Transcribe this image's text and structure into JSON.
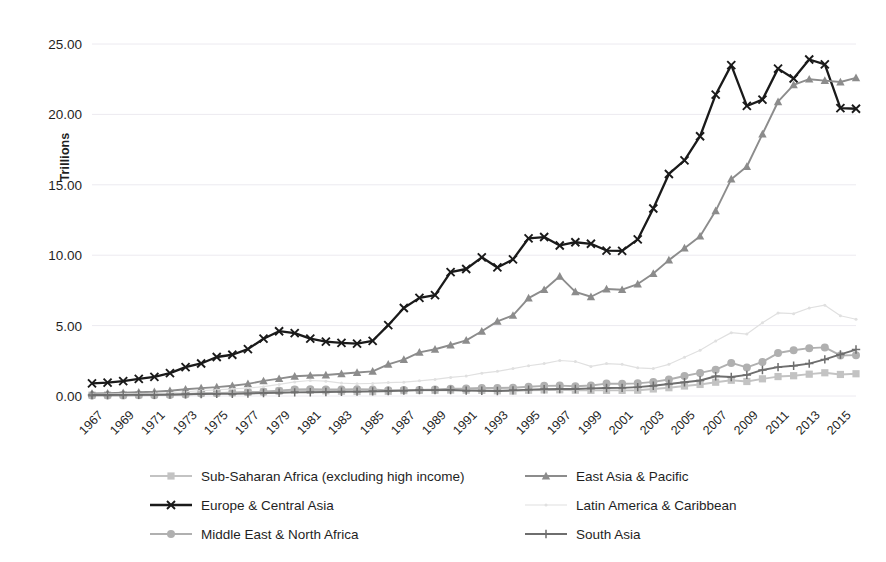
{
  "chart_data": {
    "type": "line",
    "title": "",
    "xlabel": "",
    "ylabel": "Trillions",
    "ylim": [
      0,
      25
    ],
    "ytick_labels": [
      "0.00",
      "5.00",
      "10.00",
      "15.00",
      "20.00",
      "25.00"
    ],
    "ytick_values": [
      0,
      5,
      10,
      15,
      20,
      25
    ],
    "grid": true,
    "legend_position": "bottom",
    "x": [
      1967,
      1968,
      1969,
      1970,
      1971,
      1972,
      1973,
      1974,
      1975,
      1976,
      1977,
      1978,
      1979,
      1980,
      1981,
      1982,
      1983,
      1984,
      1985,
      1986,
      1987,
      1988,
      1989,
      1990,
      1991,
      1992,
      1993,
      1994,
      1995,
      1996,
      1997,
      1998,
      1999,
      2000,
      2001,
      2002,
      2003,
      2004,
      2005,
      2006,
      2007,
      2008,
      2009,
      2010,
      2011,
      2012,
      2013,
      2014,
      2015,
      2016
    ],
    "xtick_labels": [
      "1967",
      "1969",
      "1971",
      "1973",
      "1975",
      "1977",
      "1979",
      "1981",
      "1983",
      "1985",
      "1987",
      "1989",
      "1991",
      "1993",
      "1995",
      "1997",
      "1999",
      "2001",
      "2003",
      "2005",
      "2007",
      "2009",
      "2011",
      "2013",
      "2015"
    ],
    "series": [
      {
        "name": "Sub-Saharan Africa (excluding high income)",
        "color": "#c3c3c3",
        "marker": "square",
        "values": [
          0.06,
          0.07,
          0.08,
          0.09,
          0.1,
          0.12,
          0.15,
          0.2,
          0.22,
          0.23,
          0.26,
          0.29,
          0.35,
          0.41,
          0.4,
          0.37,
          0.34,
          0.32,
          0.31,
          0.33,
          0.38,
          0.4,
          0.4,
          0.42,
          0.41,
          0.4,
          0.37,
          0.35,
          0.41,
          0.43,
          0.44,
          0.41,
          0.4,
          0.4,
          0.4,
          0.41,
          0.5,
          0.59,
          0.71,
          0.82,
          0.98,
          1.12,
          1.03,
          1.22,
          1.38,
          1.44,
          1.55,
          1.65,
          1.53,
          1.58
        ]
      },
      {
        "name": "Europe & Central Asia",
        "color": "#1a1a1a",
        "marker": "x",
        "values": [
          0.9,
          0.95,
          1.06,
          1.22,
          1.36,
          1.62,
          2.05,
          2.31,
          2.77,
          2.93,
          3.33,
          4.07,
          4.6,
          4.46,
          4.07,
          3.86,
          3.77,
          3.72,
          3.92,
          5.03,
          6.25,
          6.97,
          7.16,
          8.8,
          9.02,
          9.85,
          9.13,
          9.7,
          11.2,
          11.29,
          10.69,
          10.92,
          10.81,
          10.33,
          10.31,
          11.12,
          13.32,
          15.77,
          16.74,
          18.45,
          21.4,
          23.5,
          20.6,
          21.05,
          23.25,
          22.55,
          23.9,
          23.55,
          20.45,
          20.4
        ]
      },
      {
        "name": "Middle East & North Africa",
        "color": "#b0b0b0",
        "marker": "circle",
        "values": [
          0.03,
          0.04,
          0.04,
          0.05,
          0.06,
          0.07,
          0.1,
          0.18,
          0.2,
          0.24,
          0.28,
          0.3,
          0.38,
          0.47,
          0.48,
          0.47,
          0.47,
          0.48,
          0.47,
          0.4,
          0.42,
          0.43,
          0.46,
          0.52,
          0.53,
          0.57,
          0.57,
          0.59,
          0.66,
          0.72,
          0.74,
          0.69,
          0.75,
          0.88,
          0.87,
          0.9,
          1.0,
          1.17,
          1.42,
          1.64,
          1.87,
          2.35,
          2.03,
          2.42,
          3.05,
          3.25,
          3.4,
          3.45,
          2.88,
          2.9
        ]
      },
      {
        "name": "East Asia & Pacific",
        "color": "#8c8c8c",
        "marker": "triangle",
        "values": [
          0.18,
          0.2,
          0.23,
          0.27,
          0.3,
          0.37,
          0.48,
          0.56,
          0.63,
          0.73,
          0.86,
          1.07,
          1.23,
          1.4,
          1.46,
          1.49,
          1.58,
          1.67,
          1.75,
          2.25,
          2.58,
          3.1,
          3.32,
          3.62,
          3.95,
          4.6,
          5.3,
          5.72,
          6.95,
          7.55,
          8.5,
          7.4,
          7.05,
          7.6,
          7.55,
          7.95,
          8.7,
          9.65,
          10.5,
          11.35,
          13.15,
          15.4,
          16.3,
          18.6,
          20.9,
          22.1,
          22.5,
          22.4,
          22.3,
          22.6
        ]
      },
      {
        "name": "Latin America & Caribbean",
        "color": "#e0e0e0",
        "marker": "dot",
        "values": [
          0.12,
          0.13,
          0.15,
          0.17,
          0.19,
          0.23,
          0.3,
          0.38,
          0.43,
          0.5,
          0.57,
          0.66,
          0.82,
          1.0,
          1.1,
          1.05,
          0.92,
          0.87,
          0.89,
          0.95,
          0.98,
          1.08,
          1.18,
          1.32,
          1.42,
          1.62,
          1.75,
          1.95,
          2.15,
          2.3,
          2.52,
          2.45,
          2.1,
          2.3,
          2.25,
          2.0,
          1.95,
          2.25,
          2.75,
          3.25,
          3.9,
          4.5,
          4.4,
          5.2,
          5.9,
          5.85,
          6.25,
          6.45,
          5.7,
          5.45
        ]
      },
      {
        "name": "South Asia",
        "color": "#6e6e6e",
        "marker": "plus",
        "values": [
          0.07,
          0.07,
          0.08,
          0.09,
          0.09,
          0.1,
          0.12,
          0.14,
          0.15,
          0.15,
          0.18,
          0.21,
          0.23,
          0.26,
          0.27,
          0.28,
          0.3,
          0.31,
          0.33,
          0.35,
          0.38,
          0.42,
          0.42,
          0.43,
          0.38,
          0.37,
          0.36,
          0.4,
          0.45,
          0.48,
          0.5,
          0.5,
          0.54,
          0.57,
          0.58,
          0.63,
          0.73,
          0.85,
          0.98,
          1.1,
          1.4,
          1.35,
          1.5,
          1.85,
          2.05,
          2.15,
          2.3,
          2.6,
          2.95,
          3.3
        ]
      }
    ]
  },
  "legend": {
    "items": [
      {
        "label": "Sub-Saharan Africa (excluding high income)",
        "color": "#c3c3c3",
        "marker": "square"
      },
      {
        "label": "East Asia & Pacific",
        "color": "#8c8c8c",
        "marker": "triangle"
      },
      {
        "label": "Europe & Central Asia",
        "color": "#1a1a1a",
        "marker": "x"
      },
      {
        "label": "Latin America & Caribbean",
        "color": "#e0e0e0",
        "marker": "dot"
      },
      {
        "label": "Middle East & North Africa",
        "color": "#b0b0b0",
        "marker": "circle"
      },
      {
        "label": "South Asia",
        "color": "#6e6e6e",
        "marker": "plus"
      }
    ]
  }
}
